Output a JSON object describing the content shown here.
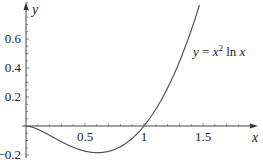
{
  "chart_data": {
    "type": "line",
    "title": "",
    "xlabel": "x",
    "ylabel": "y",
    "annotation": "y = x² ln x",
    "annotation_parts": {
      "lhs": "y = ",
      "base": "x",
      "exp": "2",
      "rest": " ln ",
      "var": "x"
    },
    "xlim": [
      0,
      1.55
    ],
    "ylim": [
      -0.2,
      0.8
    ],
    "x_ticks": [
      {
        "value": 0.5,
        "label": "0.5"
      },
      {
        "value": 1,
        "label": "1"
      },
      {
        "value": 1.5,
        "label": "1.5"
      }
    ],
    "y_ticks": [
      {
        "value": -0.2,
        "label": "−0.2"
      },
      {
        "value": 0.2,
        "label": "0.2"
      },
      {
        "value": 0.4,
        "label": "0.4"
      },
      {
        "value": 0.6,
        "label": "0.6"
      }
    ],
    "grid": false,
    "series": [
      {
        "name": "y = x^2 ln x",
        "x": [
          0.0,
          0.1,
          0.2,
          0.3,
          0.4,
          0.5,
          0.6,
          0.7,
          0.8,
          0.9,
          1.0,
          1.1,
          1.2,
          1.3,
          1.4,
          1.47
        ],
        "y": [
          0.0,
          -0.023,
          -0.064,
          -0.108,
          -0.147,
          -0.173,
          -0.184,
          -0.175,
          -0.143,
          -0.085,
          0.0,
          0.115,
          0.263,
          0.443,
          0.659,
          0.832
        ]
      }
    ]
  }
}
